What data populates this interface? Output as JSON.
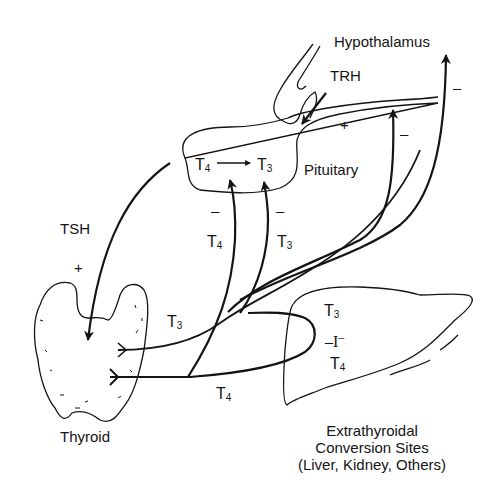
{
  "diagram": {
    "type": "physiology-feedback-diagram",
    "colors": {
      "ink": "#141414",
      "background": "#ffffff"
    },
    "organs": {
      "hypothalamus": {
        "label": "Hypothalamus"
      },
      "pituitary": {
        "label": "Pituitary",
        "conversion": {
          "from": "T",
          "from_sub": "4",
          "to": "T",
          "to_sub": "3"
        }
      },
      "thyroid": {
        "label": "Thyroid"
      },
      "extrathyroidal": {
        "label_line1": "Extrathyroidal",
        "label_line2": "Conversion Sites",
        "label_line3": "(Liver, Kidney, Others)",
        "contents": {
          "t3": "T",
          "t3_sub": "3",
          "iodide_pre": "–I",
          "iodide_sup": "–",
          "t4": "T",
          "t4_sub": "4"
        }
      }
    },
    "hormones": {
      "trh": {
        "label": "TRH",
        "effect": "+"
      },
      "tsh": {
        "label": "TSH",
        "effect": "+"
      },
      "t4_to_pituitary": {
        "label": "T",
        "sub": "4",
        "effect": "–"
      },
      "t3_to_pituitary": {
        "label": "T",
        "sub": "3",
        "effect": "–"
      },
      "t3_from_thyroid": {
        "label": "T",
        "sub": "3"
      },
      "t4_from_thyroid": {
        "label": "T",
        "sub": "4"
      },
      "feedback_to_hypothalamus_1": {
        "effect": "–"
      },
      "feedback_to_hypothalamus_2": {
        "effect": "–"
      },
      "trh_stimulation_sign": "+"
    }
  }
}
